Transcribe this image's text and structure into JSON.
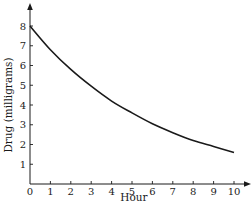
{
  "chart_data": {
    "type": "line",
    "title": "",
    "xlabel": "Hour",
    "ylabel": "Drug (milligrams)",
    "xlim": [
      0,
      10
    ],
    "ylim": [
      0,
      8
    ],
    "x_ticks": [
      "0",
      "1",
      "2",
      "3",
      "4",
      "5",
      "6",
      "7",
      "8",
      "9",
      "10"
    ],
    "y_ticks": [
      "1",
      "2",
      "3",
      "4",
      "5",
      "6",
      "7",
      "8"
    ],
    "grid": false,
    "legend": "none",
    "series": [
      {
        "name": "Drug amount",
        "x": [
          0,
          1,
          2,
          3,
          4,
          5,
          6,
          7,
          8,
          9,
          10
        ],
        "y": [
          8.0,
          6.8,
          5.8,
          4.95,
          4.2,
          3.6,
          3.05,
          2.6,
          2.2,
          1.9,
          1.6
        ]
      }
    ],
    "color": "#1a1a1a"
  }
}
